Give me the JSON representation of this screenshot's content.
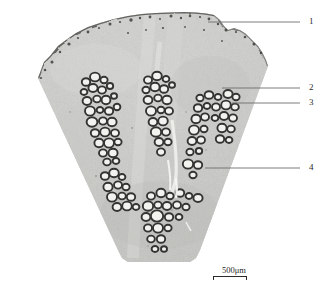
{
  "figure": {
    "kind": "histological-micrograph",
    "specimen_shape": "wedge",
    "callouts": [
      {
        "id": "1",
        "label": "1",
        "y": 18,
        "leader_from_x": 208,
        "leader_y": 22
      },
      {
        "id": "2",
        "label": "2",
        "y": 84,
        "leader_from_x": 222,
        "leader_y": 88
      },
      {
        "id": "3",
        "label": "3",
        "y": 99,
        "leader_from_x": 232,
        "leader_y": 103
      },
      {
        "id": "4",
        "label": "4",
        "y": 164,
        "leader_from_x": 205,
        "leader_y": 168
      }
    ],
    "scalebar": {
      "label": "500μm",
      "value": "500",
      "unit": "μm"
    },
    "caption": "",
    "colors": {
      "tissue_light": "#d8d8d6",
      "tissue_mid": "#c2c2bf",
      "tissue_dark": "#a9a9a6",
      "vessel_lumen": "#f4f4f1",
      "vessel_wall": "#3a3a38",
      "leader_line": "#6e6e6e",
      "label_text": "#2b2b2b",
      "background": "#ffffff"
    }
  }
}
